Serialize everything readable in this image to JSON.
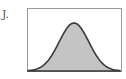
{
  "figure": {
    "option_label": "J.",
    "panel": {
      "box": {
        "x": 27,
        "y": 8,
        "w": 94,
        "h": 64,
        "stroke": "#9a9a9a"
      },
      "curve": {
        "shape": "bell-curve",
        "stroke": "#3a3a3a",
        "fill": "#c4c4c4",
        "peak_x": 74,
        "peak_y": 23,
        "baseline_y": 71
      }
    }
  }
}
